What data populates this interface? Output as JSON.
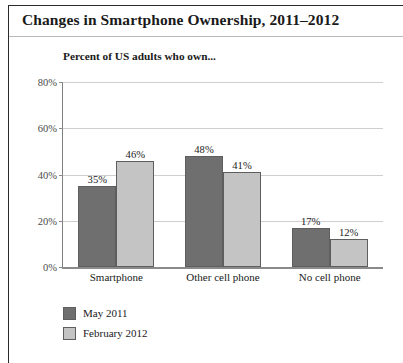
{
  "figure": {
    "title": "Changes in Smartphone Ownership, 2011–2012",
    "subtitle": "Percent of US adults who own..."
  },
  "colors": {
    "series1": "#6f6f6f",
    "series2": "#c4c4c4",
    "bar_outline": "#5e5e5e",
    "gridline": "#cfcfcf",
    "axis": "#8a8a8a",
    "frame": "#2b2b2b",
    "text": "#1a1a1a",
    "tick_text": "#4a4a4a"
  },
  "chart_data": {
    "type": "bar",
    "title": "Changes in Smartphone Ownership, 2011–2012",
    "subtitle": "Percent of US adults who own...",
    "xlabel": "",
    "ylabel": "",
    "ylim": [
      0,
      80
    ],
    "yticks": [
      0,
      20,
      40,
      60,
      80
    ],
    "ytick_labels": [
      "0%",
      "20%",
      "40%",
      "60%",
      "80%"
    ],
    "grid": true,
    "legend_position": "below-left",
    "categories": [
      "Smartphone",
      "Other cell phone",
      "No cell phone"
    ],
    "series": [
      {
        "name": "May 2011",
        "color": "#6f6f6f",
        "values": [
          35,
          48,
          17
        ],
        "value_labels": [
          "35%",
          "48%",
          "17%"
        ]
      },
      {
        "name": "February 2012",
        "color": "#c4c4c4",
        "values": [
          46,
          41,
          12
        ],
        "value_labels": [
          "46%",
          "41%",
          "12%"
        ]
      }
    ]
  },
  "legend": {
    "items": [
      {
        "label": "May 2011",
        "color": "#6f6f6f"
      },
      {
        "label": "February 2012",
        "color": "#c4c4c4"
      }
    ]
  }
}
